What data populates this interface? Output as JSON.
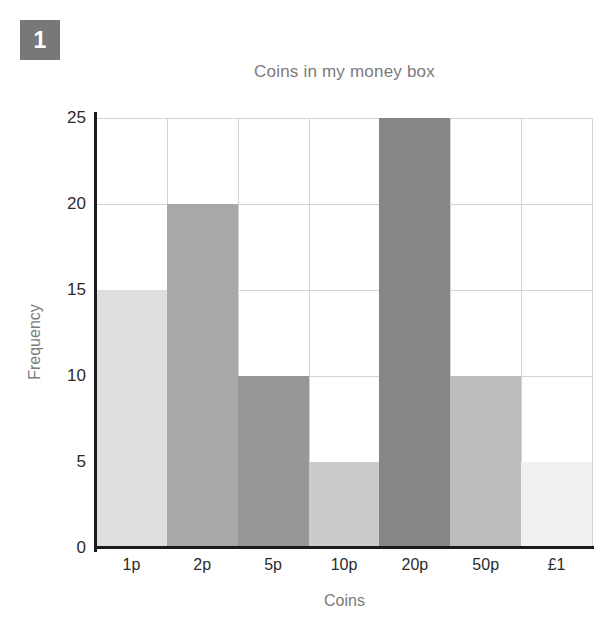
{
  "badge": {
    "label": "1",
    "color": "#787878"
  },
  "chart_data": {
    "type": "bar",
    "title": "Coins in my money box",
    "xlabel": "Coins",
    "ylabel": "Frequency",
    "categories": [
      "1p",
      "2p",
      "5p",
      "10p",
      "20p",
      "50p",
      "£1"
    ],
    "values": [
      15,
      20,
      10,
      5,
      25,
      10,
      5
    ],
    "bar_colors": [
      "#dedede",
      "#a8a8a8",
      "#979797",
      "#cbcbcb",
      "#868686",
      "#bcbcbc",
      "#f1f1f1"
    ],
    "ylim": [
      0,
      25
    ],
    "ytick_labels": [
      "0",
      "5",
      "10",
      "15",
      "20",
      "25"
    ],
    "ytick_values": [
      0,
      5,
      10,
      15,
      20,
      25
    ],
    "grid": true,
    "legend": false,
    "bar_gap": 0,
    "axis_color": "#1b1b1b",
    "grid_color": "#d2d2d2",
    "title_color": "#7b7b7b"
  }
}
